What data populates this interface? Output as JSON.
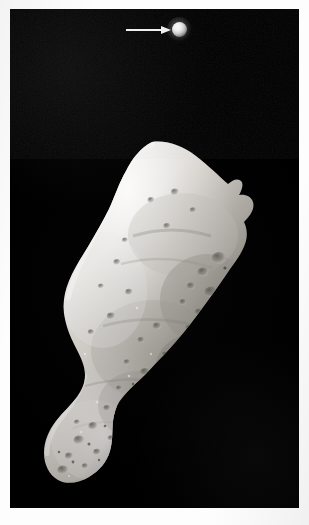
{
  "image": {
    "subject": "asteroid",
    "subject_name": "243 Ida",
    "companion_name": "Dactyl",
    "background_color": "#000000",
    "page_color": "#fdfdfd",
    "frame": {
      "left": 10,
      "top": 9,
      "width": 289,
      "height": 499
    }
  },
  "annotation": {
    "arrow": {
      "icon": "arrow-right-icon",
      "color": "#f2f2f2",
      "points_to": "Dactyl",
      "x": 126,
      "y": 25,
      "length": 48
    },
    "moon": {
      "label": "Dactyl",
      "x": 172,
      "y": 22,
      "diameter": 15,
      "highlight_color": "#ffffff"
    }
  },
  "asteroid": {
    "label": "Ida",
    "illumination": "lit from left, terminator on right",
    "surface": "heavily cratered regolith",
    "bright_color": "#e6e4e0",
    "mid_color": "#b4b1ab",
    "shadow_color": "#4a4845",
    "bounds": {
      "left": 33,
      "top": 140,
      "width": 235,
      "height": 355
    }
  }
}
